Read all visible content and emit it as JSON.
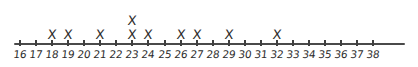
{
  "chart_data": {
    "type": "scatter",
    "plot_style": "dot-plot-x-marks",
    "title": "",
    "subtitle": "",
    "xlabel": "",
    "ylabel": "",
    "grid": false,
    "legend": null,
    "xlim": [
      16,
      38
    ],
    "axis_tick_step": 1,
    "tick_labels": [
      "16",
      "17",
      "18",
      "19",
      "20",
      "21",
      "22",
      "23",
      "24",
      "25",
      "26",
      "27",
      "28",
      "29",
      "30",
      "31",
      "32",
      "33",
      "34",
      "35",
      "36",
      "37",
      "38"
    ],
    "categories": [
      16,
      17,
      18,
      19,
      20,
      21,
      22,
      23,
      24,
      25,
      26,
      27,
      28,
      29,
      30,
      31,
      32,
      33,
      34,
      35,
      36,
      37,
      38
    ],
    "values": [
      0,
      0,
      1,
      1,
      0,
      1,
      0,
      2,
      1,
      0,
      1,
      1,
      0,
      1,
      0,
      0,
      1,
      0,
      0,
      0,
      0,
      0,
      0
    ],
    "data_points": [
      18,
      19,
      21,
      23,
      23,
      24,
      26,
      27,
      29,
      32
    ],
    "total_marks": 10,
    "mark_glyph": "X",
    "colors": {
      "ink": "#2b2b2b",
      "axis": "#4a4a4a",
      "background": "#ffffff"
    }
  },
  "layout": {
    "axis_start_px": 14,
    "axis_end_px": 405,
    "first_tick_px": 20,
    "tick_spacing_px": 16.06,
    "axis_y_px": 43,
    "row_height_px": 14,
    "first_row_y_px": 28
  }
}
